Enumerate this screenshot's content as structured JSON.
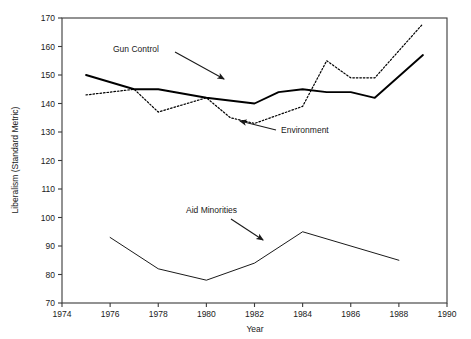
{
  "chart_data": {
    "type": "line",
    "title": "",
    "xlabel": "Year",
    "ylabel": "Liberalism (Standard Metric)",
    "xlim": [
      1974,
      1990
    ],
    "ylim": [
      70,
      170
    ],
    "xticks": [
      1974,
      1976,
      1978,
      1980,
      1982,
      1984,
      1986,
      1988,
      1990
    ],
    "yticks": [
      70,
      80,
      90,
      100,
      110,
      120,
      130,
      140,
      150,
      160,
      170
    ],
    "grid": false,
    "legend_position": "annotations-inline",
    "series": [
      {
        "name": "Gun Control",
        "style": "solid",
        "color": "#000000",
        "x": [
          1975,
          1977,
          1978,
          1980,
          1982,
          1983,
          1984,
          1985,
          1986,
          1987,
          1989
        ],
        "values": [
          150,
          145,
          145,
          142,
          140,
          144,
          145,
          144,
          144,
          142,
          157
        ]
      },
      {
        "name": "Environment",
        "style": "dotted",
        "color": "#000000",
        "x": [
          1975,
          1977,
          1978,
          1980,
          1981,
          1982,
          1983,
          1984,
          1985,
          1986,
          1987,
          1989
        ],
        "values": [
          143,
          145,
          137,
          142,
          135,
          133,
          136,
          139,
          155,
          149,
          149,
          168
        ]
      },
      {
        "name": "Aid Minorities",
        "style": "solid-thin",
        "color": "#000000",
        "x": [
          1976,
          1978,
          1980,
          1982,
          1984,
          1988
        ],
        "values": [
          93,
          82,
          78,
          84,
          95,
          85
        ]
      }
    ],
    "annotations": [
      {
        "label": "Gun Control",
        "text_x": 113,
        "text_y": 52,
        "arrow_from_x": 175,
        "arrow_from_y": 52,
        "arrow_to_x": 224,
        "arrow_to_y": 79
      },
      {
        "label": "Environment",
        "text_x": 281,
        "text_y": 133,
        "arrow_from_x": 276,
        "arrow_from_y": 130,
        "arrow_to_x": 240,
        "arrow_to_y": 121
      },
      {
        "label": "Aid Minorities",
        "text_x": 186,
        "text_y": 213,
        "arrow_from_x": 231,
        "arrow_from_y": 219,
        "arrow_to_x": 263,
        "arrow_to_y": 240
      }
    ]
  }
}
